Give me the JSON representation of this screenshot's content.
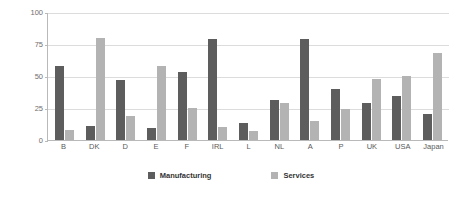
{
  "chart_data": {
    "type": "bar",
    "title": "",
    "xlabel": "",
    "ylabel": "",
    "ylim": [
      0,
      100
    ],
    "yticks": [
      0,
      25,
      50,
      75,
      100
    ],
    "ytick_labels": [
      "0",
      "25",
      "50",
      "75",
      "100"
    ],
    "grid": true,
    "legend_position": "bottom-center",
    "categories": [
      "B",
      "DK",
      "D",
      "E",
      "F",
      "IRL",
      "L",
      "NL",
      "A",
      "P",
      "UK",
      "USA",
      "Japan"
    ],
    "series": [
      {
        "name": "Manufacturing",
        "color": "#5d5d5d",
        "values": [
          58,
          11,
          47,
          9,
          53,
          79,
          13,
          31,
          79,
          40,
          29,
          34,
          20
        ]
      },
      {
        "name": "Services",
        "color": "#b3b3b3",
        "values": [
          8,
          80,
          19,
          58,
          25,
          10,
          7,
          29,
          15,
          24,
          48,
          50,
          68
        ]
      }
    ]
  },
  "legend": {
    "entries": [
      {
        "label": "Manufacturing",
        "swatch": "manufacturing-swatch"
      },
      {
        "label": "Services",
        "swatch": "services-swatch"
      }
    ]
  },
  "colors": {
    "manufacturing": "#5d5d5d",
    "services": "#b3b3b3",
    "axis": "#b9b9b9",
    "gridline": "#dcdcdc",
    "tick_text": "#6e6e6e",
    "category_text": "#5a5a5a",
    "legend_text": "#333333",
    "background": "#ffffff"
  }
}
